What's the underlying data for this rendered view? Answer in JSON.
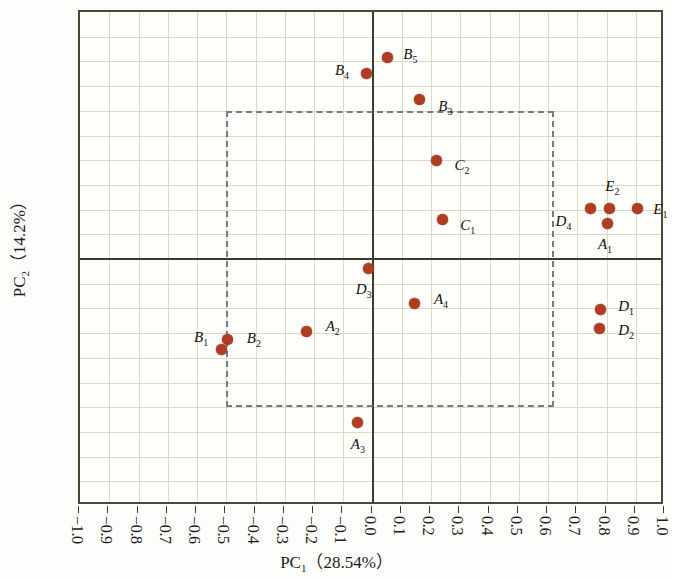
{
  "chart_data": {
    "type": "scatter",
    "title": "",
    "xlabel": "PC₁（28.54%）",
    "ylabel": "PC₂（14.2%）",
    "xlabel_main": "PC",
    "xlabel_sub": "1",
    "xlabel_paren": "（28.54%）",
    "ylabel_main": "PC",
    "ylabel_sub": "2",
    "ylabel_paren": "（14.2%）",
    "xlim": [
      -1.0,
      1.0
    ],
    "ylim": [
      -1.0,
      1.0
    ],
    "grid": true,
    "legend": "none",
    "point_color": "#b03d23",
    "axis_color": "#3b3b2c",
    "grid_color": "#ded9c4",
    "dashed_box_color": "#737a8c",
    "xticks": [
      "-1.0",
      "-0.9",
      "-0.8",
      "-0.7",
      "-0.6",
      "-0.5",
      "-0.4",
      "-0.3",
      "-0.2",
      "-0.1",
      "0.0",
      "0.1",
      "0.2",
      "0.3",
      "0.4",
      "0.5",
      "0.6",
      "0.7",
      "0.8",
      "0.9",
      "1.0"
    ],
    "yticks": [
      "1.0",
      "0.9",
      "0.8",
      "0.7",
      "0.6",
      "0.5",
      "0.4",
      "0.3",
      "0.2",
      "0.1",
      "0.0",
      "-0.1",
      "-0.2",
      "-0.3",
      "-0.4",
      "-0.5",
      "-0.6",
      "-0.7",
      "-0.8",
      "-0.9",
      "-1.0"
    ],
    "xtick_values": [
      -1.0,
      -0.9,
      -0.8,
      -0.7,
      -0.6,
      -0.5,
      -0.4,
      -0.3,
      -0.2,
      -0.1,
      0.0,
      0.1,
      0.2,
      0.3,
      0.4,
      0.5,
      0.6,
      0.7,
      0.8,
      0.9,
      1.0
    ],
    "ytick_values": [
      1.0,
      0.9,
      0.8,
      0.7,
      0.6,
      0.5,
      0.4,
      0.3,
      0.2,
      0.1,
      0.0,
      -0.1,
      -0.2,
      -0.3,
      -0.4,
      -0.5,
      -0.6,
      -0.7,
      -0.8,
      -0.9,
      -1.0
    ],
    "dashed_box": {
      "x0": -0.5,
      "x1": 0.62,
      "y0": -0.6,
      "y1": 0.6
    },
    "points": [
      {
        "id": "A1",
        "base": "A",
        "sub": "1",
        "x": 0.805,
        "y": 0.145,
        "lx": 0.795,
        "ly": 0.055,
        "anchor": "center"
      },
      {
        "id": "A2",
        "base": "A",
        "sub": "2",
        "x": -0.225,
        "y": -0.295,
        "lx": -0.16,
        "ly": -0.275,
        "anchor": "left"
      },
      {
        "id": "A3",
        "base": "A",
        "sub": "3",
        "x": -0.05,
        "y": -0.66,
        "lx": -0.05,
        "ly": -0.755,
        "anchor": "center"
      },
      {
        "id": "A4",
        "base": "A",
        "sub": "4",
        "x": 0.145,
        "y": -0.18,
        "lx": 0.21,
        "ly": -0.165,
        "anchor": "left"
      },
      {
        "id": "B1",
        "base": "B",
        "sub": "1",
        "x": -0.515,
        "y": -0.365,
        "lx": -0.61,
        "ly": -0.32,
        "anchor": "left"
      },
      {
        "id": "B2",
        "base": "B",
        "sub": "2",
        "x": -0.495,
        "y": -0.325,
        "lx": -0.43,
        "ly": -0.325,
        "anchor": "left"
      },
      {
        "id": "B3",
        "base": "B",
        "sub": "3",
        "x": 0.16,
        "y": 0.645,
        "lx": 0.225,
        "ly": 0.615,
        "anchor": "left"
      },
      {
        "id": "B4",
        "base": "B",
        "sub": "4",
        "x": -0.02,
        "y": 0.75,
        "lx": -0.08,
        "ly": 0.76,
        "anchor": "right"
      },
      {
        "id": "B5",
        "base": "B",
        "sub": "5",
        "x": 0.05,
        "y": 0.815,
        "lx": 0.105,
        "ly": 0.825,
        "anchor": "left"
      },
      {
        "id": "C1",
        "base": "C",
        "sub": "1",
        "x": 0.24,
        "y": 0.16,
        "lx": 0.3,
        "ly": 0.135,
        "anchor": "left"
      },
      {
        "id": "C2",
        "base": "C",
        "sub": "2",
        "x": 0.22,
        "y": 0.4,
        "lx": 0.28,
        "ly": 0.375,
        "anchor": "left"
      },
      {
        "id": "D1",
        "base": "D",
        "sub": "1",
        "x": 0.78,
        "y": -0.205,
        "lx": 0.84,
        "ly": -0.195,
        "anchor": "left"
      },
      {
        "id": "D2",
        "base": "D",
        "sub": "2",
        "x": 0.775,
        "y": -0.28,
        "lx": 0.84,
        "ly": -0.29,
        "anchor": "left"
      },
      {
        "id": "D3",
        "base": "D",
        "sub": "3",
        "x": -0.015,
        "y": -0.04,
        "lx": -0.03,
        "ly": -0.125,
        "anchor": "center"
      },
      {
        "id": "D4",
        "base": "D",
        "sub": "4",
        "x": 0.745,
        "y": 0.205,
        "lx": 0.68,
        "ly": 0.15,
        "anchor": "right"
      },
      {
        "id": "E1",
        "base": "E",
        "sub": "1",
        "x": 0.905,
        "y": 0.205,
        "lx": 0.96,
        "ly": 0.2,
        "anchor": "left"
      },
      {
        "id": "E2",
        "base": "E",
        "sub": "2",
        "x": 0.81,
        "y": 0.205,
        "lx": 0.82,
        "ly": 0.29,
        "anchor": "center"
      }
    ]
  }
}
